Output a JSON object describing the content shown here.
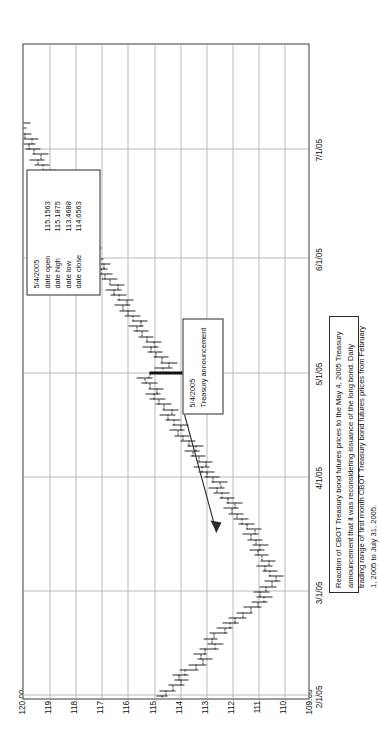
{
  "figure": {
    "caption": "Reaction of CBOT Treasury bond futures prices to the May 4, 2005 Treasury announcement that it was reconsidering issuance of the long bond. Daily trading range of first month CBOT Treasury bond futures prices from February 1, 2005 to July 31, 2005.",
    "orientation": "rotated-90-ccw"
  },
  "annotations": {
    "event": {
      "date": "5/4/2005",
      "label": "Treasury announcement"
    },
    "ohlc": {
      "date": "5/4/2005",
      "rows": [
        {
          "key": "date open",
          "value": "115.1563"
        },
        {
          "key": "date high",
          "value": "115.1875"
        },
        {
          "key": "date low",
          "value": "113.4688"
        },
        {
          "key": "date close",
          "value": "114.6563"
        }
      ]
    }
  },
  "chart_data": {
    "type": "ohlc",
    "title": "",
    "subtitle": "",
    "xlabel": "",
    "ylabel": "",
    "grid": true,
    "legend": null,
    "xlim": [
      "2/1/05",
      "7/31/05"
    ],
    "ylim": [
      109.0,
      120.0
    ],
    "ytick_labels": [
      "120.00",
      "119.00",
      "118.00",
      "117.00",
      "116.00",
      "115.00",
      "114.00",
      "113.00",
      "112.00",
      "111.00",
      "110.00",
      "109.00"
    ],
    "yticks": [
      120,
      119,
      118,
      117,
      116,
      115,
      114,
      113,
      112,
      111,
      110,
      109
    ],
    "xtick_labels": [
      "2/1/05",
      "3/1/05",
      "4/1/05",
      "5/1/05",
      "6/1/05",
      "7/1/05"
    ],
    "xticks_index": [
      0,
      20,
      42,
      62,
      84,
      105
    ],
    "series_name": "First month CBOT Treasury bond futures",
    "columns": [
      "open",
      "high",
      "low",
      "close"
    ],
    "bars": [
      {
        "i": 0,
        "open": 114.72,
        "high": 114.91,
        "low": 114.47,
        "close": 114.56
      },
      {
        "i": 1,
        "open": 114.56,
        "high": 114.78,
        "low": 114.16,
        "close": 114.28
      },
      {
        "i": 2,
        "open": 114.28,
        "high": 114.44,
        "low": 113.81,
        "close": 113.97
      },
      {
        "i": 3,
        "open": 113.97,
        "high": 114.22,
        "low": 113.66,
        "close": 114.06
      },
      {
        "i": 4,
        "open": 114.06,
        "high": 114.31,
        "low": 113.69,
        "close": 113.84
      },
      {
        "i": 5,
        "open": 113.84,
        "high": 114.03,
        "low": 113.28,
        "close": 113.41
      },
      {
        "i": 6,
        "open": 113.41,
        "high": 113.66,
        "low": 113.0,
        "close": 113.12
      },
      {
        "i": 7,
        "open": 113.12,
        "high": 113.34,
        "low": 112.75,
        "close": 113.22
      },
      {
        "i": 8,
        "open": 113.22,
        "high": 113.5,
        "low": 112.97,
        "close": 113.06
      },
      {
        "i": 9,
        "open": 113.06,
        "high": 113.25,
        "low": 112.53,
        "close": 112.66
      },
      {
        "i": 10,
        "open": 112.66,
        "high": 112.94,
        "low": 112.34,
        "close": 112.81
      },
      {
        "i": 11,
        "open": 112.81,
        "high": 113.09,
        "low": 112.56,
        "close": 112.72
      },
      {
        "i": 12,
        "open": 112.72,
        "high": 112.88,
        "low": 112.19,
        "close": 112.31
      },
      {
        "i": 13,
        "open": 112.31,
        "high": 112.59,
        "low": 111.97,
        "close": 112.09
      },
      {
        "i": 14,
        "open": 112.09,
        "high": 112.38,
        "low": 111.75,
        "close": 111.91
      },
      {
        "i": 15,
        "open": 111.91,
        "high": 112.16,
        "low": 111.44,
        "close": 111.59
      },
      {
        "i": 16,
        "open": 111.59,
        "high": 111.84,
        "low": 111.22,
        "close": 111.31
      },
      {
        "i": 17,
        "open": 111.31,
        "high": 111.56,
        "low": 110.88,
        "close": 111.03
      },
      {
        "i": 18,
        "open": 111.03,
        "high": 111.28,
        "low": 110.66,
        "close": 110.81
      },
      {
        "i": 19,
        "open": 110.81,
        "high": 111.09,
        "low": 110.47,
        "close": 110.94
      },
      {
        "i": 20,
        "open": 110.94,
        "high": 111.19,
        "low": 110.59,
        "close": 110.72
      },
      {
        "i": 21,
        "open": 110.72,
        "high": 110.97,
        "low": 110.31,
        "close": 110.5
      },
      {
        "i": 22,
        "open": 110.5,
        "high": 110.78,
        "low": 110.16,
        "close": 110.34
      },
      {
        "i": 23,
        "open": 110.34,
        "high": 110.62,
        "low": 110.03,
        "close": 110.56
      },
      {
        "i": 24,
        "open": 110.56,
        "high": 110.84,
        "low": 110.25,
        "close": 110.78
      },
      {
        "i": 25,
        "open": 110.78,
        "high": 111.06,
        "low": 110.47,
        "close": 110.62
      },
      {
        "i": 26,
        "open": 110.62,
        "high": 110.91,
        "low": 110.34,
        "close": 110.88
      },
      {
        "i": 27,
        "open": 110.88,
        "high": 111.16,
        "low": 110.62,
        "close": 111.03
      },
      {
        "i": 28,
        "open": 111.03,
        "high": 111.34,
        "low": 110.75,
        "close": 110.94
      },
      {
        "i": 29,
        "open": 110.94,
        "high": 111.22,
        "low": 110.59,
        "close": 111.12
      },
      {
        "i": 30,
        "open": 111.12,
        "high": 111.41,
        "low": 110.84,
        "close": 111.28
      },
      {
        "i": 31,
        "open": 111.28,
        "high": 111.59,
        "low": 111.0,
        "close": 111.16
      },
      {
        "i": 32,
        "open": 111.16,
        "high": 111.47,
        "low": 110.88,
        "close": 111.44
      },
      {
        "i": 33,
        "open": 111.44,
        "high": 111.75,
        "low": 111.16,
        "close": 111.66
      },
      {
        "i": 34,
        "open": 111.66,
        "high": 111.97,
        "low": 111.38,
        "close": 111.84
      },
      {
        "i": 35,
        "open": 111.84,
        "high": 112.16,
        "low": 111.56,
        "close": 112.03
      },
      {
        "i": 36,
        "open": 112.03,
        "high": 112.34,
        "low": 111.75,
        "close": 111.91
      },
      {
        "i": 37,
        "open": 111.91,
        "high": 112.22,
        "low": 111.62,
        "close": 112.19
      },
      {
        "i": 38,
        "open": 112.19,
        "high": 112.5,
        "low": 111.91,
        "close": 112.41
      },
      {
        "i": 39,
        "open": 112.41,
        "high": 112.72,
        "low": 112.12,
        "close": 112.59
      },
      {
        "i": 40,
        "open": 112.59,
        "high": 112.91,
        "low": 112.31,
        "close": 112.47
      },
      {
        "i": 41,
        "open": 112.47,
        "high": 112.78,
        "low": 112.19,
        "close": 112.75
      },
      {
        "i": 42,
        "open": 112.75,
        "high": 113.06,
        "low": 112.47,
        "close": 112.97
      },
      {
        "i": 43,
        "open": 112.97,
        "high": 113.28,
        "low": 112.69,
        "close": 113.16
      },
      {
        "i": 44,
        "open": 113.16,
        "high": 113.47,
        "low": 112.88,
        "close": 113.03
      },
      {
        "i": 45,
        "open": 113.03,
        "high": 113.34,
        "low": 112.75,
        "close": 113.31
      },
      {
        "i": 46,
        "open": 113.31,
        "high": 113.62,
        "low": 113.03,
        "close": 113.53
      },
      {
        "i": 47,
        "open": 113.53,
        "high": 113.84,
        "low": 113.25,
        "close": 113.41
      },
      {
        "i": 48,
        "open": 113.41,
        "high": 113.72,
        "low": 113.12,
        "close": 113.69
      },
      {
        "i": 49,
        "open": 113.69,
        "high": 114.0,
        "low": 113.41,
        "close": 113.91
      },
      {
        "i": 50,
        "open": 113.91,
        "high": 114.22,
        "low": 113.62,
        "close": 114.09
      },
      {
        "i": 51,
        "open": 114.09,
        "high": 114.41,
        "low": 113.81,
        "close": 113.97
      },
      {
        "i": 52,
        "open": 113.97,
        "high": 114.28,
        "low": 113.69,
        "close": 114.25
      },
      {
        "i": 53,
        "open": 114.25,
        "high": 114.56,
        "low": 113.97,
        "close": 114.47
      },
      {
        "i": 54,
        "open": 114.47,
        "high": 114.78,
        "low": 114.19,
        "close": 114.34
      },
      {
        "i": 55,
        "open": 114.34,
        "high": 114.66,
        "low": 114.06,
        "close": 114.62
      },
      {
        "i": 56,
        "open": 114.62,
        "high": 114.94,
        "low": 114.34,
        "close": 114.84
      },
      {
        "i": 57,
        "open": 114.84,
        "high": 115.16,
        "low": 114.56,
        "close": 115.03
      },
      {
        "i": 58,
        "open": 115.03,
        "high": 115.34,
        "low": 114.75,
        "close": 114.91
      },
      {
        "i": 59,
        "open": 114.91,
        "high": 115.22,
        "low": 114.62,
        "close": 115.16
      },
      {
        "i": 60,
        "open": 115.16,
        "high": 115.47,
        "low": 114.88,
        "close": 115.34
      },
      {
        "i": 61,
        "open": 115.34,
        "high": 115.66,
        "low": 115.06,
        "close": 115.22
      },
      {
        "i": 62,
        "open": 115.1563,
        "high": 115.1875,
        "low": 113.4688,
        "close": 114.6563,
        "event": true
      },
      {
        "i": 63,
        "open": 114.66,
        "high": 114.97,
        "low": 114.28,
        "close": 114.44
      },
      {
        "i": 64,
        "open": 114.44,
        "high": 114.75,
        "low": 114.09,
        "close": 114.72
      },
      {
        "i": 65,
        "open": 114.72,
        "high": 115.03,
        "low": 114.44,
        "close": 114.94
      },
      {
        "i": 66,
        "open": 114.94,
        "high": 115.25,
        "low": 114.66,
        "close": 115.12
      },
      {
        "i": 67,
        "open": 115.12,
        "high": 115.44,
        "low": 114.84,
        "close": 115.0
      },
      {
        "i": 68,
        "open": 115.0,
        "high": 115.31,
        "low": 114.72,
        "close": 115.28
      },
      {
        "i": 69,
        "open": 115.28,
        "high": 115.59,
        "low": 115.0,
        "close": 115.47
      },
      {
        "i": 70,
        "open": 115.47,
        "high": 115.78,
        "low": 115.19,
        "close": 115.66
      },
      {
        "i": 71,
        "open": 115.66,
        "high": 115.97,
        "low": 115.38,
        "close": 115.53
      },
      {
        "i": 72,
        "open": 115.53,
        "high": 115.84,
        "low": 115.25,
        "close": 115.81
      },
      {
        "i": 73,
        "open": 115.81,
        "high": 116.12,
        "low": 115.53,
        "close": 116.0
      },
      {
        "i": 74,
        "open": 116.0,
        "high": 116.31,
        "low": 115.72,
        "close": 116.19
      },
      {
        "i": 75,
        "open": 116.19,
        "high": 116.5,
        "low": 115.91,
        "close": 116.06
      },
      {
        "i": 76,
        "open": 116.06,
        "high": 116.38,
        "low": 115.78,
        "close": 116.34
      },
      {
        "i": 77,
        "open": 116.34,
        "high": 116.66,
        "low": 116.06,
        "close": 116.53
      },
      {
        "i": 78,
        "open": 116.53,
        "high": 116.84,
        "low": 116.25,
        "close": 116.41
      },
      {
        "i": 79,
        "open": 116.41,
        "high": 116.72,
        "low": 116.12,
        "close": 116.69
      },
      {
        "i": 80,
        "open": 116.69,
        "high": 117.0,
        "low": 116.41,
        "close": 116.88
      },
      {
        "i": 81,
        "open": 116.88,
        "high": 117.19,
        "low": 116.59,
        "close": 117.06
      },
      {
        "i": 82,
        "open": 117.06,
        "high": 117.38,
        "low": 116.78,
        "close": 116.94
      },
      {
        "i": 83,
        "open": 116.94,
        "high": 117.25,
        "low": 116.66,
        "close": 117.22
      },
      {
        "i": 84,
        "open": 117.22,
        "high": 117.53,
        "low": 116.94,
        "close": 117.41
      },
      {
        "i": 85,
        "open": 117.41,
        "high": 117.72,
        "low": 117.12,
        "close": 117.28
      },
      {
        "i": 86,
        "open": 117.28,
        "high": 117.59,
        "low": 117.0,
        "close": 117.56
      },
      {
        "i": 87,
        "open": 117.56,
        "high": 117.88,
        "low": 117.28,
        "close": 117.75
      },
      {
        "i": 88,
        "open": 117.75,
        "high": 118.06,
        "low": 117.47,
        "close": 117.62
      },
      {
        "i": 89,
        "open": 117.62,
        "high": 117.94,
        "low": 117.34,
        "close": 117.91
      },
      {
        "i": 90,
        "open": 117.91,
        "high": 118.22,
        "low": 117.62,
        "close": 118.09
      },
      {
        "i": 91,
        "open": 118.09,
        "high": 118.41,
        "low": 117.81,
        "close": 117.97
      },
      {
        "i": 92,
        "open": 117.97,
        "high": 118.28,
        "low": 117.69,
        "close": 118.25
      },
      {
        "i": 93,
        "open": 118.25,
        "high": 118.56,
        "low": 117.97,
        "close": 118.44
      },
      {
        "i": 94,
        "open": 118.44,
        "high": 118.75,
        "low": 118.16,
        "close": 118.31
      },
      {
        "i": 95,
        "open": 118.31,
        "high": 118.62,
        "low": 118.03,
        "close": 118.59
      },
      {
        "i": 96,
        "open": 118.59,
        "high": 118.91,
        "low": 118.31,
        "close": 118.78
      },
      {
        "i": 97,
        "open": 118.78,
        "high": 119.09,
        "low": 118.5,
        "close": 118.66
      },
      {
        "i": 98,
        "open": 118.66,
        "high": 118.97,
        "low": 118.38,
        "close": 118.94
      },
      {
        "i": 99,
        "open": 118.94,
        "high": 119.25,
        "low": 118.66,
        "close": 119.12
      },
      {
        "i": 100,
        "open": 119.12,
        "high": 119.44,
        "low": 118.84,
        "close": 119.0
      },
      {
        "i": 101,
        "open": 119.0,
        "high": 119.31,
        "low": 118.72,
        "close": 119.28
      },
      {
        "i": 102,
        "open": 119.28,
        "high": 119.59,
        "low": 119.0,
        "close": 119.47
      },
      {
        "i": 103,
        "open": 119.47,
        "high": 119.78,
        "low": 119.19,
        "close": 119.34
      },
      {
        "i": 104,
        "open": 119.34,
        "high": 119.66,
        "low": 119.06,
        "close": 119.62
      },
      {
        "i": 105,
        "open": 119.62,
        "high": 119.94,
        "low": 119.34,
        "close": 119.81
      },
      {
        "i": 106,
        "open": 119.81,
        "high": 120.12,
        "low": 119.53,
        "close": 119.69
      },
      {
        "i": 107,
        "open": 119.69,
        "high": 120.0,
        "low": 119.41,
        "close": 119.97
      },
      {
        "i": 108,
        "open": 119.97,
        "high": 120.28,
        "low": 119.69,
        "close": 120.16
      },
      {
        "i": 109,
        "open": 120.16,
        "high": 120.47,
        "low": 119.88,
        "close": 120.03
      },
      {
        "i": 110,
        "open": 120.03,
        "high": 120.34,
        "low": 119.75,
        "close": 120.31
      },
      {
        "i": 111,
        "open": 120.31,
        "high": 120.62,
        "low": 120.03,
        "close": 120.5
      },
      {
        "i": 112,
        "open": 120.5,
        "high": 120.81,
        "low": 120.22,
        "close": 120.38
      },
      {
        "i": 113,
        "open": 120.38,
        "high": 120.69,
        "low": 120.09,
        "close": 120.66
      },
      {
        "i": 114,
        "open": 120.66,
        "high": 120.97,
        "low": 120.38,
        "close": 120.84
      },
      {
        "i": 115,
        "open": 120.84,
        "high": 121.16,
        "low": 120.56,
        "close": 120.72
      },
      {
        "i": 116,
        "open": 120.72,
        "high": 121.03,
        "low": 120.44,
        "close": 121.0
      },
      {
        "i": 117,
        "open": 121.0,
        "high": 121.31,
        "low": 120.72,
        "close": 121.19
      },
      {
        "i": 118,
        "open": 121.19,
        "high": 121.5,
        "low": 120.91,
        "close": 121.06
      },
      {
        "i": 119,
        "open": 121.06,
        "high": 121.38,
        "low": 120.78,
        "close": 121.34
      },
      {
        "i": 120,
        "open": 121.34,
        "high": 121.66,
        "low": 121.06,
        "close": 121.53
      },
      {
        "i": 121,
        "open": 121.53,
        "high": 121.84,
        "low": 121.25,
        "close": 121.41
      },
      {
        "i": 122,
        "open": 121.41,
        "high": 121.72,
        "low": 121.12,
        "close": 121.69
      },
      {
        "i": 123,
        "open": 121.69,
        "high": 122.0,
        "low": 121.41,
        "close": 121.88
      },
      {
        "i": 124,
        "open": 121.88,
        "high": 122.19,
        "low": 121.59,
        "close": 121.75
      },
      {
        "i": 125,
        "open": 121.75,
        "high": 122.06,
        "low": 121.47,
        "close": 122.03
      }
    ]
  }
}
